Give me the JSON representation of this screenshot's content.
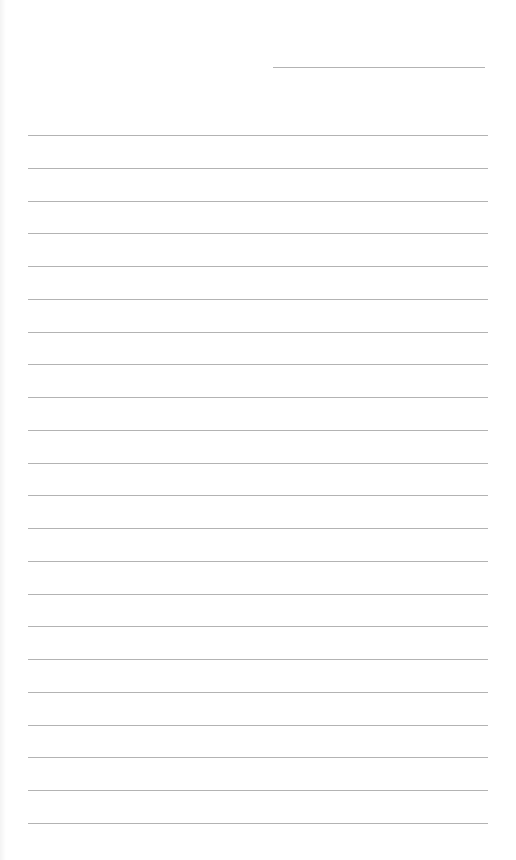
{
  "document": {
    "type": "lined-paper",
    "background_color": "#ffffff",
    "line_color": "#b3b3b3",
    "header_line": {
      "label": "",
      "x_start": 273,
      "x_end": 485,
      "y": 67
    },
    "ruled_lines": {
      "count": 22,
      "first_y": 135,
      "spacing": 32.75,
      "x_start": 28,
      "x_end": 488,
      "entries": [
        "",
        "",
        "",
        "",
        "",
        "",
        "",
        "",
        "",
        "",
        "",
        "",
        "",
        "",
        "",
        "",
        "",
        "",
        "",
        "",
        "",
        ""
      ]
    }
  }
}
